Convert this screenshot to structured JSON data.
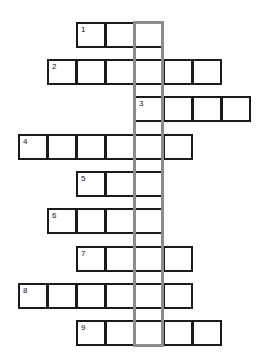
{
  "puzzle": {
    "type": "crossword",
    "cell_size": 29,
    "origin_x": 18,
    "key_column_index": 4,
    "key_color": "#8c8c8c",
    "border_color": "#1a1a1a",
    "rows": [
      {
        "number": "1",
        "top": 22,
        "start_col": 2,
        "length": 3
      },
      {
        "number": "2",
        "top": 59,
        "start_col": 1,
        "length": 6
      },
      {
        "number": "3",
        "top": 96,
        "start_col": 4,
        "length": 4
      },
      {
        "number": "4",
        "top": 134,
        "start_col": 0,
        "length": 6
      },
      {
        "number": "5",
        "top": 171,
        "start_col": 2,
        "length": 3
      },
      {
        "number": "6",
        "top": 208,
        "start_col": 1,
        "length": 4
      },
      {
        "number": "7",
        "top": 246,
        "start_col": 2,
        "length": 4
      },
      {
        "number": "8",
        "top": 283,
        "start_col": 0,
        "length": 6
      },
      {
        "number": "9",
        "top": 320,
        "start_col": 2,
        "length": 5
      }
    ],
    "key_column": {
      "top": 21,
      "bottom": 347
    }
  }
}
